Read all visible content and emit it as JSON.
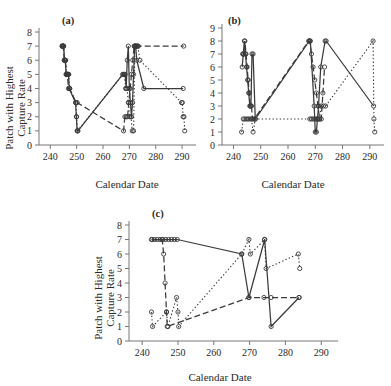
{
  "figure": {
    "axis_titles": {
      "x": "Calendar Date",
      "y_line1": "Patch with Highest",
      "y_line2": "Capture Rate"
    }
  },
  "chart_data": [
    {
      "type": "line",
      "panel": "(a)",
      "title": "",
      "xlabel": "Calendar Date",
      "ylabel": "Patch with Highest Capture Rate",
      "xlim": [
        238,
        293
      ],
      "ylim": [
        0,
        8
      ],
      "xticks": [
        240,
        250,
        260,
        270,
        280,
        290
      ],
      "yticks": [
        0,
        1,
        2,
        3,
        4,
        5,
        6,
        7,
        8
      ],
      "grid": false,
      "legend": "none",
      "marker": "open-circle",
      "series": [
        {
          "name": "solid",
          "style": "solid",
          "x": [
            244.5,
            244.8,
            245.1,
            245.4,
            245.7,
            246.0,
            246.3,
            246.6,
            246.9,
            247.2,
            249.6,
            249.9,
            250.2,
            250.5,
            267.5,
            268.0,
            268.4,
            268.8,
            269.2,
            269.6,
            270.0,
            270.4,
            270.8,
            271.2,
            271.6,
            272.0,
            272.4,
            272.8,
            275.5,
            290.4
          ],
          "y": [
            7,
            7,
            7,
            6,
            6,
            5,
            5,
            5,
            5,
            4,
            3,
            2,
            1,
            1,
            5,
            5,
            5,
            4,
            6,
            7,
            4,
            3,
            2,
            3,
            5,
            7,
            7,
            6,
            4,
            4
          ]
        },
        {
          "name": "dashed",
          "style": "dashed",
          "x": [
            244.5,
            244.9,
            245.3,
            245.7,
            246.1,
            246.5,
            246.9,
            247.3,
            249.8,
            250.2,
            267.8,
            268.3,
            268.8,
            269.3,
            269.8,
            270.3,
            270.8,
            271.3,
            271.8,
            272.3,
            272.8,
            273.4,
            290.6
          ],
          "y": [
            7,
            7,
            6,
            6,
            5,
            5,
            4,
            4,
            3,
            3,
            1,
            2,
            2,
            2,
            3,
            4,
            5,
            6,
            7,
            7,
            7,
            7,
            7
          ]
        },
        {
          "name": "dotted",
          "style": "dotted",
          "x": [
            244.6,
            245.0,
            245.4,
            245.8,
            246.2,
            246.6,
            247.0,
            247.4,
            249.7,
            250.0,
            250.3,
            267.6,
            268.1,
            268.6,
            269.1,
            269.6,
            270.1,
            270.6,
            271.1,
            271.6,
            272.1,
            272.6,
            273.2,
            274.0,
            289.8,
            290.1,
            290.4,
            290.7,
            291.0
          ],
          "y": [
            7,
            7,
            6,
            6,
            5,
            5,
            5,
            4,
            3,
            2,
            1,
            5,
            5,
            4,
            4,
            3,
            2,
            2,
            1,
            1,
            7,
            7,
            7,
            6,
            3,
            3,
            2,
            2,
            1
          ]
        }
      ]
    },
    {
      "type": "line",
      "panel": "(b)",
      "title": "",
      "xlabel": "Calendar Date",
      "ylabel": "Patch with Highest Capture Rate",
      "xlim": [
        238,
        293
      ],
      "ylim": [
        0,
        9
      ],
      "xticks": [
        240,
        250,
        260,
        270,
        280,
        290
      ],
      "yticks": [
        0,
        1,
        2,
        3,
        4,
        5,
        6,
        7,
        8,
        9
      ],
      "grid": false,
      "legend": "none",
      "marker": "open-circle",
      "series": [
        {
          "name": "solid",
          "style": "solid",
          "x": [
            243.2,
            243.6,
            244.0,
            244.4,
            244.8,
            245.2,
            245.6,
            246.0,
            246.4,
            246.8,
            247.2,
            248.0,
            267.8,
            268.2,
            269.6,
            270.0,
            270.4,
            270.8,
            271.2,
            272.0,
            273.6,
            274.0,
            291.4
          ],
          "y": [
            6,
            7,
            8,
            7,
            6,
            5,
            4,
            3,
            3,
            7,
            7,
            2,
            8,
            8,
            3,
            1,
            1,
            2,
            3,
            6,
            8,
            8,
            3
          ]
        },
        {
          "name": "dashed",
          "style": "dashed",
          "x": [
            243.4,
            243.8,
            244.2,
            244.6,
            245.0,
            245.4,
            245.8,
            246.2,
            246.6,
            247.0,
            247.6,
            267.6,
            268.0,
            268.6,
            269.2,
            269.8,
            270.4,
            271.0,
            271.6,
            272.2,
            272.8,
            273.4
          ],
          "y": [
            7,
            7,
            8,
            7,
            6,
            5,
            4,
            3,
            3,
            2,
            2,
            8,
            8,
            7,
            6,
            5,
            4,
            3,
            2,
            2,
            4,
            6
          ]
        },
        {
          "name": "dotted",
          "style": "dotted",
          "x": [
            243.0,
            243.6,
            244.2,
            244.8,
            245.4,
            246.0,
            246.6,
            247.2,
            248.0,
            268.0,
            268.6,
            269.2,
            269.8,
            270.4,
            271.0,
            271.6,
            272.2,
            273.0,
            273.8,
            291.2,
            291.5,
            291.8
          ],
          "y": [
            1,
            2,
            2,
            2,
            2,
            2,
            2,
            1,
            2,
            2,
            2,
            2,
            2,
            2,
            2,
            2,
            3,
            3,
            3,
            8,
            2,
            1
          ]
        }
      ]
    },
    {
      "type": "line",
      "panel": "(c)",
      "title": "",
      "xlabel": "Calendar Date",
      "ylabel": "Patch with Highest Capture Rate",
      "xlim": [
        238,
        293
      ],
      "ylim": [
        0,
        8
      ],
      "xticks": [
        240,
        250,
        260,
        270,
        280,
        290
      ],
      "yticks": [
        0,
        1,
        2,
        3,
        4,
        5,
        6,
        7,
        8
      ],
      "grid": false,
      "legend": "none",
      "marker": "open-circle",
      "series": [
        {
          "name": "solid",
          "style": "solid",
          "x": [
            242.6,
            243.4,
            244.2,
            245.0,
            245.8,
            246.6,
            247.4,
            248.2,
            249.0,
            249.8,
            267.8,
            269.8,
            274.2,
            276.0,
            283.8
          ],
          "y": [
            7,
            7,
            7,
            7,
            7,
            7,
            7,
            7,
            7,
            7,
            6,
            3,
            7,
            1,
            3
          ]
        },
        {
          "name": "dashed",
          "style": "dashed",
          "x": [
            242.8,
            245.6,
            246.0,
            246.4,
            246.8,
            247.0,
            269.8,
            274.0,
            276.0,
            283.8
          ],
          "y": [
            7,
            7,
            6,
            4,
            2,
            1,
            3,
            3,
            3,
            3
          ]
        },
        {
          "name": "dotted",
          "style": "dotted",
          "x": [
            242.6,
            242.9,
            246.8,
            247.2,
            249.6,
            250.0,
            250.2,
            267.8,
            269.8,
            270.2,
            274.2,
            274.6,
            283.6,
            284.0
          ],
          "y": [
            2,
            1,
            2,
            1,
            3,
            2,
            1,
            6,
            7,
            6,
            7,
            5,
            6,
            5
          ]
        }
      ]
    }
  ]
}
